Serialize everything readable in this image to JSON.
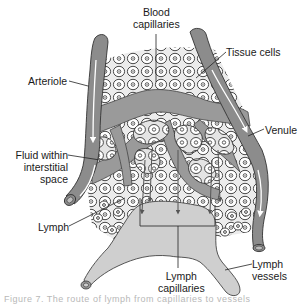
{
  "diagram": {
    "labels": {
      "blood_capillaries": [
        "Blood",
        "capillaries"
      ],
      "tissue_cells": "Tissue cells",
      "arteriole": "Arteriole",
      "venule": "Venule",
      "fluid": [
        "Fluid within",
        "interstitial",
        "space"
      ],
      "lymph": "Lymph",
      "lymph_capillaries": [
        "Lymph",
        "capillaries"
      ],
      "lymph_vessels": [
        "Lymph",
        "vessels"
      ]
    },
    "caption": "Figure 7.  The  route  of  lymph  from  capillaries  to  vessels"
  },
  "colors": {
    "vessel": "#8c8c8c",
    "vessel_dark": "#6e6e6e",
    "capillary_network": "#9a9a9a",
    "tissue_bg": "#e9e9e9",
    "cell_fill": "#ffffff",
    "lymph_fill": "#cfcfcf",
    "outline": "#333333",
    "text": "#1a1a1a"
  }
}
